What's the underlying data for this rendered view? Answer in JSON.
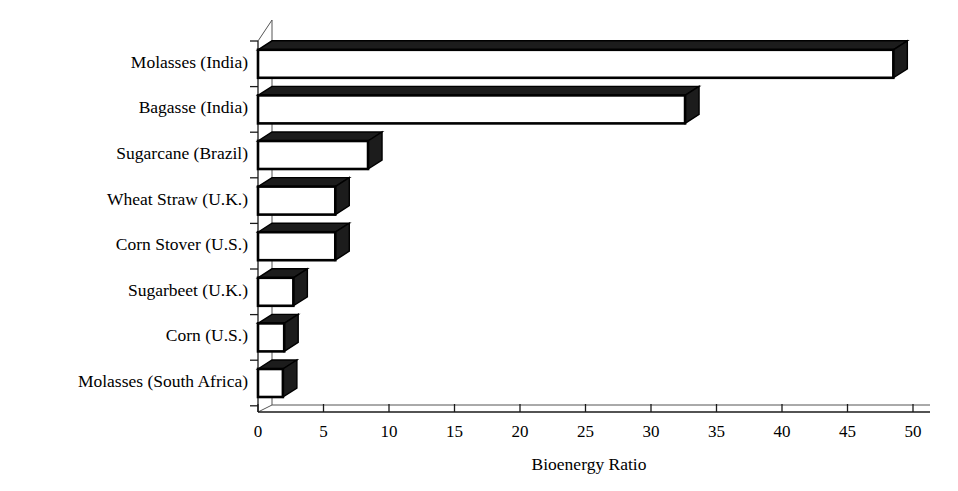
{
  "chart_data": {
    "type": "bar",
    "orientation": "horizontal",
    "title": "",
    "xlabel": "Bioenergy Ratio",
    "ylabel": "",
    "categories": [
      "Molasses (India)",
      "Bagasse (India)",
      "Sugarcane (Brazil)",
      "Wheat Straw (U.K.)",
      "Corn Stover (U.S.)",
      "Sugarbeet (U.K.)",
      "Corn (U.S.)",
      "Molasses (South Africa)"
    ],
    "values": [
      48.5,
      32.6,
      8.4,
      5.9,
      5.9,
      2.7,
      2.0,
      1.9
    ],
    "xlim": [
      0,
      50
    ],
    "xticks": [
      0,
      5,
      10,
      15,
      20,
      25,
      30,
      35,
      40,
      45,
      50
    ],
    "xtick_labels": [
      "0",
      "5",
      "10",
      "15",
      "20",
      "25",
      "30",
      "35",
      "40",
      "45",
      "50"
    ],
    "grid": false,
    "legend": null,
    "style": "3d-bars-white-fill-black-outline"
  },
  "axis": {
    "x_title": "Bioenergy Ratio"
  },
  "colors": {
    "bar_fill": "#ffffff",
    "bar_outline": "#000000",
    "bar_shade": "#1c1c1c",
    "axis": "#1a1a1a",
    "text": "#000000",
    "background": "#ffffff"
  }
}
